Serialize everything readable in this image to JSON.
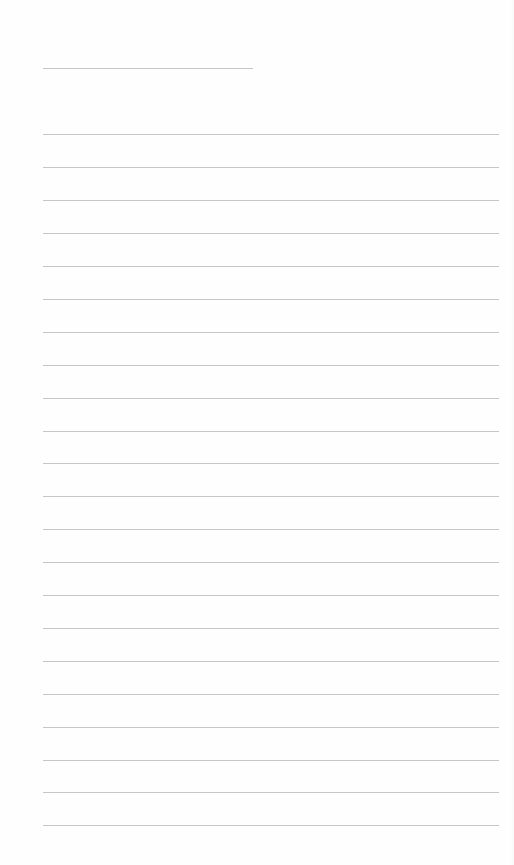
{
  "page": {
    "type": "blank lined sheet",
    "background_color": "#fefefe",
    "line_color": "#c6c6c6",
    "title_line": {
      "label": "",
      "x": 43,
      "y": 68,
      "width": 210
    },
    "ruled_lines": {
      "count": 22,
      "x": 43,
      "width": 456,
      "first_y": 134,
      "spacing": 32.9,
      "positions": [
        134,
        167,
        200,
        233,
        266,
        299,
        332,
        365,
        398,
        431,
        463,
        496,
        529,
        562,
        595,
        628,
        661,
        694,
        727,
        760,
        792,
        825
      ],
      "contents": [
        "",
        "",
        "",
        "",
        "",
        "",
        "",
        "",
        "",
        "",
        "",
        "",
        "",
        "",
        "",
        "",
        "",
        "",
        "",
        "",
        "",
        ""
      ]
    }
  }
}
